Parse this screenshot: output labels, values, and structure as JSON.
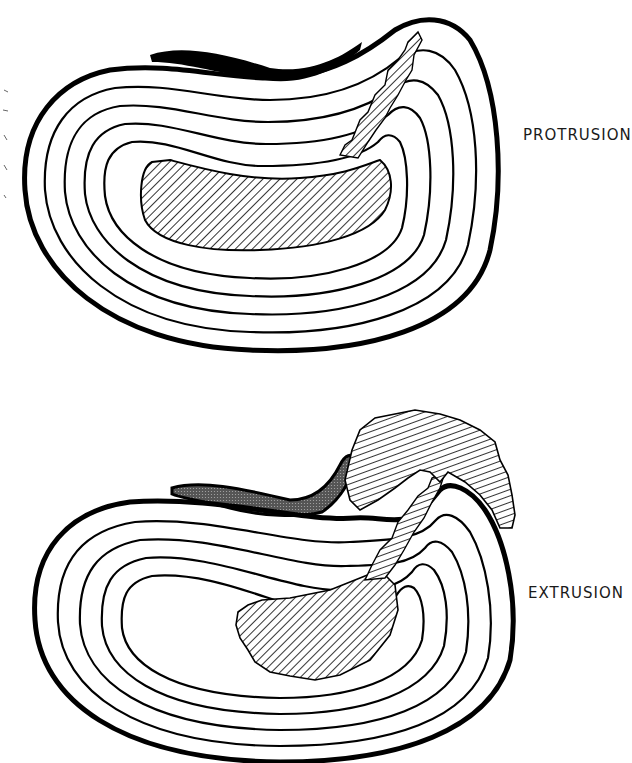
{
  "diagrams": [
    {
      "id": "protrusion",
      "label": "PROTRUSION",
      "description": "Intervertebral disc cross-section with concentric annular rings; hatched nucleus pulposus tracks through torn annulus fibers toward the posterior edge without breaching the outer ring."
    },
    {
      "id": "extrusion",
      "label": "EXTRUSION",
      "description": "Intervertebral disc cross-section; hatched nucleus material passes through all annular rings and extrudes beyond the outer boundary; stippled posterior longitudinal ligament displaced."
    }
  ],
  "colors": {
    "ink": "#000000",
    "paper": "#ffffff",
    "label": "#1a1a1a"
  }
}
